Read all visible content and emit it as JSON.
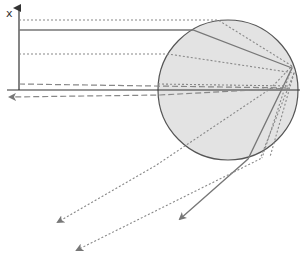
{
  "diagram": {
    "axis": {
      "vertical_label": "x",
      "origin": [
        19,
        90
      ],
      "vertical_top": 6,
      "horizontal_left": 7,
      "horizontal_right": 300
    },
    "droplet": {
      "cx": 228,
      "cy": 90,
      "r": 70,
      "fill": "#e3e3e3",
      "stroke": "#555555"
    },
    "colors": {
      "axis": "#333333",
      "solid_ray": "#777777",
      "dashed_ray": "#888888"
    },
    "incident_rays": [
      {
        "id": "ray-1",
        "style": "dotted",
        "y": 20
      },
      {
        "id": "ray-2",
        "style": "solid",
        "y": 30
      },
      {
        "id": "ray-3",
        "style": "dotted",
        "y": 54
      },
      {
        "id": "ray-4",
        "style": "dashed",
        "y": 84
      }
    ],
    "emergent_rays": [
      {
        "id": "out-4",
        "style": "dashed",
        "end": [
          10,
          97
        ]
      },
      {
        "id": "out-1",
        "style": "dotted",
        "end": [
          58,
          222
        ]
      },
      {
        "id": "out-3",
        "style": "dotted",
        "end": [
          77,
          250
        ]
      },
      {
        "id": "out-2",
        "style": "solid",
        "end": [
          180,
          219
        ]
      }
    ]
  }
}
